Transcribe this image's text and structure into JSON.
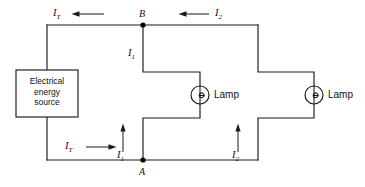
{
  "diagram": {
    "type": "electrical-circuit-schematic",
    "background_color": "#ffffff",
    "line_color": "#1a1a1a",
    "width": 365,
    "height": 187
  },
  "source": {
    "name": "electrical-energy-source",
    "line1": "Electrical",
    "line2": "energy",
    "line3": "source"
  },
  "nodes": [
    {
      "id": "B",
      "label": "B",
      "x": 143,
      "y": 25
    },
    {
      "id": "A",
      "label": "A",
      "x": 143,
      "y": 160
    }
  ],
  "lamps": [
    {
      "id": "lamp-1",
      "label": "Lamp",
      "cx": 200,
      "cy": 95
    },
    {
      "id": "lamp-2",
      "label": "Lamp",
      "cx": 314,
      "cy": 95
    }
  ],
  "currents": {
    "total_symbol": "I",
    "total_subscript": "T",
    "branch1_symbol": "I",
    "branch1_subscript": "1",
    "branch2_symbol": "I",
    "branch2_subscript": "2"
  },
  "labels": {
    "top_total": {
      "symbol": "I",
      "sub": "T",
      "arrow": "left"
    },
    "top_branch2": {
      "symbol": "I",
      "sub": "2",
      "arrow": "left"
    },
    "mid_branch1": {
      "symbol": "I",
      "sub": "1",
      "arrow": "none"
    },
    "bottom_total": {
      "symbol": "I",
      "sub": "T",
      "arrow": "right"
    },
    "bottom_branch1": {
      "symbol": "I",
      "sub": "1",
      "arrow": "up"
    },
    "bottom_branch2": {
      "symbol": "I",
      "sub": "2",
      "arrow": "up"
    }
  }
}
